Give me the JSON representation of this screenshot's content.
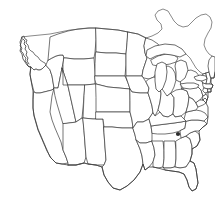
{
  "map": {
    "title": "Blank outline map of the contiguous United States",
    "region": "United States of America",
    "projection_style": "conic",
    "caption": "",
    "background_color": "#ffffff",
    "outline_color": "#3a3a3a",
    "state_fill_color": "#ffffff",
    "marker_color": "#2b2b2b",
    "width_px": 215,
    "height_px": 207,
    "features": {
      "states_shown": "contiguous 48",
      "labels_shown": "none",
      "graticule_shown": "none",
      "legend_shown": "none"
    },
    "markers": [
      {
        "name": "location-marker",
        "shape": "filled-dot",
        "x": 178,
        "y": 134,
        "radius": 2.1,
        "color": "#2b2b2b",
        "region": "North Carolina"
      }
    ]
  }
}
